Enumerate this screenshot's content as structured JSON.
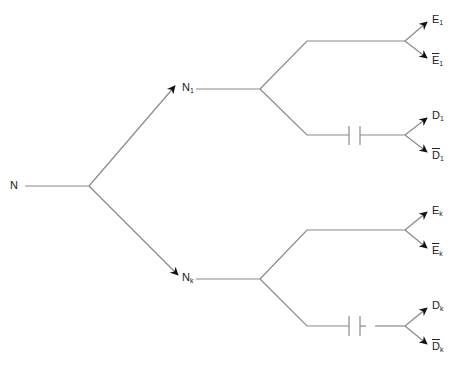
{
  "diagram": {
    "type": "tree",
    "line_color": "#8a8a8a",
    "arrow_color": "#111111",
    "nodes": {
      "root": {
        "label": "N",
        "sub": ""
      },
      "n1": {
        "label": "N",
        "sub": "1"
      },
      "nk": {
        "label": "N",
        "sub": "k"
      },
      "e1": {
        "label": "E",
        "sub": "1"
      },
      "e1bar": {
        "label": "E",
        "sub": "1",
        "overline": true
      },
      "d1": {
        "label": "D",
        "sub": "1"
      },
      "d1bar": {
        "label": "D",
        "sub": "1",
        "overline": true
      },
      "ek": {
        "label": "E",
        "sub": "k"
      },
      "ekbar": {
        "label": "E",
        "sub": "k",
        "overline": true
      },
      "dk": {
        "label": "D",
        "sub": "k"
      },
      "dkbar": {
        "label": "D",
        "sub": "k",
        "overline": true
      }
    },
    "edges": [
      {
        "from": "root",
        "to": "n1",
        "arrow": true
      },
      {
        "from": "root",
        "to": "nk",
        "arrow": true
      },
      {
        "from": "n1",
        "to": "e1",
        "arrow": true
      },
      {
        "from": "n1",
        "to": "e1bar",
        "arrow": true
      },
      {
        "from": "n1",
        "to": "d1",
        "arrow": true,
        "capacitor": true
      },
      {
        "from": "n1",
        "to": "d1bar",
        "arrow": true,
        "capacitor": true
      },
      {
        "from": "nk",
        "to": "ek",
        "arrow": true
      },
      {
        "from": "nk",
        "to": "ekbar",
        "arrow": true
      },
      {
        "from": "nk",
        "to": "dk",
        "arrow": true,
        "capacitor": true
      },
      {
        "from": "nk",
        "to": "dkbar",
        "arrow": true,
        "capacitor": true
      }
    ]
  }
}
